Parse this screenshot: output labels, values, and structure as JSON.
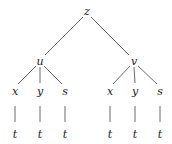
{
  "diagram": {
    "type": "tree",
    "line_color": "#444444",
    "text_color": "#222222",
    "nodes": [
      {
        "id": "z",
        "label": "z",
        "x": 87,
        "y": 11
      },
      {
        "id": "u",
        "label": "u",
        "x": 40,
        "y": 61
      },
      {
        "id": "v",
        "label": "v",
        "x": 134,
        "y": 61
      },
      {
        "id": "ux",
        "label": "x",
        "x": 15,
        "y": 91
      },
      {
        "id": "uy",
        "label": "y",
        "x": 40,
        "y": 91
      },
      {
        "id": "us",
        "label": "s",
        "x": 65,
        "y": 91
      },
      {
        "id": "vx",
        "label": "x",
        "x": 110,
        "y": 91
      },
      {
        "id": "vy",
        "label": "y",
        "x": 135,
        "y": 91
      },
      {
        "id": "vs",
        "label": "s",
        "x": 160,
        "y": 91
      },
      {
        "id": "t1",
        "label": "t",
        "x": 15,
        "y": 134
      },
      {
        "id": "t2",
        "label": "t",
        "x": 40,
        "y": 134
      },
      {
        "id": "t3",
        "label": "t",
        "x": 65,
        "y": 134
      },
      {
        "id": "t4",
        "label": "t",
        "x": 110,
        "y": 134
      },
      {
        "id": "t5",
        "label": "t",
        "x": 135,
        "y": 134
      },
      {
        "id": "t6",
        "label": "t",
        "x": 160,
        "y": 134
      }
    ],
    "edges": [
      [
        "z",
        "u"
      ],
      [
        "z",
        "v"
      ],
      [
        "u",
        "ux"
      ],
      [
        "u",
        "uy"
      ],
      [
        "u",
        "us"
      ],
      [
        "v",
        "vx"
      ],
      [
        "v",
        "vy"
      ],
      [
        "v",
        "vs"
      ],
      [
        "ux",
        "t1"
      ],
      [
        "uy",
        "t2"
      ],
      [
        "us",
        "t3"
      ],
      [
        "vx",
        "t4"
      ],
      [
        "vy",
        "t5"
      ],
      [
        "vs",
        "t6"
      ]
    ]
  }
}
